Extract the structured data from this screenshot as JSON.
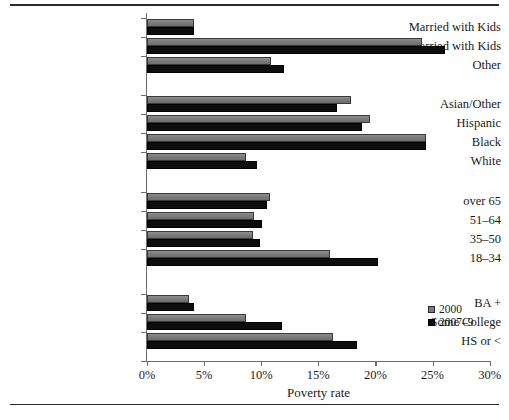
{
  "chart_data": {
    "type": "bar",
    "orientation": "horizontal",
    "title": "",
    "xlabel": "Poverty rate",
    "ylabel": "",
    "xlim": [
      0,
      30
    ],
    "xticks": [
      0,
      5,
      10,
      15,
      20,
      25,
      30
    ],
    "xtick_labels": [
      "0%",
      "5%",
      "10%",
      "15%",
      "20%",
      "25%",
      "30%"
    ],
    "grid": false,
    "legend_position": "lower-right",
    "categories": [
      "Married with Kids",
      "Nonmarried with Kids",
      "Other",
      "Asian/Other",
      "Hispanic",
      "Black",
      "White",
      "over 65",
      "51–64",
      "35–50",
      "18–34",
      "BA +",
      "Some College",
      "HS or <"
    ],
    "groups": [
      {
        "name": "family",
        "categories": [
          "Married with Kids",
          "Nonmarried with Kids",
          "Other"
        ]
      },
      {
        "name": "race",
        "categories": [
          "Asian/Other",
          "Hispanic",
          "Black",
          "White"
        ]
      },
      {
        "name": "age",
        "categories": [
          "over 65",
          "51–64",
          "35–50",
          "18–34"
        ]
      },
      {
        "name": "education",
        "categories": [
          "BA +",
          "Some College",
          "HS or <"
        ]
      }
    ],
    "series": [
      {
        "name": "2000",
        "color": "#7c7c7c",
        "values": [
          4.1,
          24.1,
          10.9,
          17.9,
          19.5,
          24.4,
          8.7,
          10.8,
          9.4,
          9.3,
          16.0,
          3.7,
          8.7,
          16.3
        ]
      },
      {
        "name": "2007–9",
        "color": "#0d0d0d",
        "values": [
          4.1,
          26.1,
          12.0,
          16.6,
          18.8,
          24.4,
          9.6,
          10.5,
          10.1,
          9.9,
          20.2,
          4.1,
          11.8,
          18.4
        ]
      }
    ]
  },
  "legend": {
    "entries": [
      {
        "label": "2000",
        "swatch": "s2000"
      },
      {
        "label": "2007–9",
        "swatch": "s2007"
      }
    ]
  },
  "caption": {
    "text": ""
  }
}
